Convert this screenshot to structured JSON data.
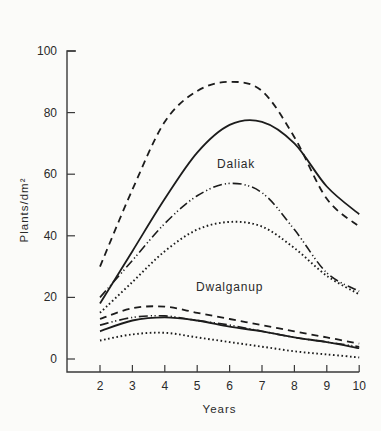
{
  "chart_data": {
    "type": "line",
    "title": "",
    "xlabel": "Years",
    "ylabel": "Plants/dm²",
    "x": [
      2,
      3,
      4,
      5,
      6,
      7,
      8,
      9,
      10
    ],
    "xlim": [
      1,
      10
    ],
    "ylim": [
      -3,
      100
    ],
    "x_ticks": [
      2,
      3,
      4,
      5,
      6,
      7,
      8,
      9,
      10
    ],
    "y_ticks": [
      0,
      20,
      40,
      60,
      80,
      100
    ],
    "grid": false,
    "legend": null,
    "annotations": [
      {
        "text": "Daliak",
        "x": 6.2,
        "y": 62
      },
      {
        "text": "Dwalganup",
        "x": 6.0,
        "y": 22
      }
    ],
    "series": [
      {
        "name": "Daliak A",
        "group": "Daliak",
        "style": "dashed",
        "values": [
          30,
          55,
          77,
          87,
          90,
          87,
          72,
          52,
          43
        ]
      },
      {
        "name": "Daliak B",
        "group": "Daliak",
        "style": "solid",
        "values": [
          18,
          35,
          52,
          67,
          76,
          77,
          70,
          56,
          47
        ]
      },
      {
        "name": "Daliak C",
        "group": "Daliak",
        "style": "dash-dot-dot",
        "values": [
          20,
          32,
          44,
          53,
          57,
          54,
          42,
          28,
          22
        ]
      },
      {
        "name": "Daliak D",
        "group": "Daliak",
        "style": "dotted",
        "values": [
          15,
          25,
          35,
          42,
          44.5,
          43,
          36,
          27,
          21
        ]
      },
      {
        "name": "Dwalganup A",
        "group": "Dwalganup",
        "style": "dashed",
        "values": [
          13,
          16.5,
          17,
          15,
          13,
          11,
          9,
          7,
          5
        ]
      },
      {
        "name": "Dwalganup C",
        "group": "Dwalganup",
        "style": "dash-dot-dot",
        "values": [
          11,
          13.5,
          14,
          12.5,
          11,
          9,
          7,
          5.5,
          4
        ]
      },
      {
        "name": "Dwalganup B",
        "group": "Dwalganup",
        "style": "solid",
        "values": [
          9,
          12.5,
          13.5,
          12.5,
          10.5,
          9,
          7,
          5.5,
          3.5
        ]
      },
      {
        "name": "Dwalganup D",
        "group": "Dwalganup",
        "style": "dotted",
        "values": [
          6,
          8,
          8.5,
          7,
          5.5,
          4,
          2.5,
          1.5,
          0.5
        ]
      }
    ]
  },
  "layout": {
    "plot": {
      "x0px": 67,
      "x_at_2": 100,
      "px_per_year": 32.4,
      "y_zero_px": 359,
      "px_per_unit": 3.08,
      "axis_bottom_px": 372,
      "y_top_px": 51
    },
    "line_color": "#1c1c1c",
    "axis_color": "#3a3a3a"
  }
}
